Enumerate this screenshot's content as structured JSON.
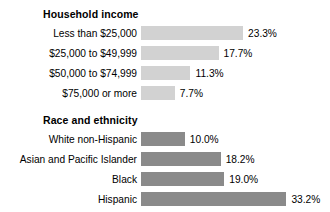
{
  "chart_data": {
    "type": "bar",
    "title": "",
    "xlabel": "",
    "ylabel": "",
    "orientation": "horizontal",
    "grid": false,
    "legend": "none",
    "value_suffix": "%",
    "xlim": [
      0,
      33.2
    ],
    "panels": [
      {
        "title": "Household income",
        "bar_color": "#d2d2d2",
        "categories": [
          "Less than $25,000",
          "$25,000 to $49,999",
          "$50,000 to $74,999",
          "$75,000 or more"
        ],
        "values": [
          23.3,
          17.7,
          11.3,
          7.7
        ],
        "value_labels": [
          "23.3%",
          "17.7%",
          "11.3%",
          "7.7%"
        ]
      },
      {
        "title": "Race and ethnicity",
        "bar_color": "#8a8a8a",
        "categories": [
          "White non-Hispanic",
          "Asian and Pacific Islander",
          "Black",
          "Hispanic"
        ],
        "values": [
          10.0,
          18.2,
          19.0,
          33.2
        ],
        "value_labels": [
          "10.0%",
          "18.2%",
          "19.0%",
          "33.2%"
        ]
      }
    ]
  },
  "layout": {
    "canvas_width": 330,
    "canvas_height": 212,
    "bar_origin_x": 141,
    "px_per_percent": 4.38,
    "bar_height": 14,
    "row_pitch": 20,
    "label_right_edge": 137,
    "value_gap": 5,
    "panel_tops": [
      4,
      110
    ],
    "panel_title_tops": [
      8,
      114
    ],
    "panel_rows_tops": [
      24,
      130
    ]
  }
}
